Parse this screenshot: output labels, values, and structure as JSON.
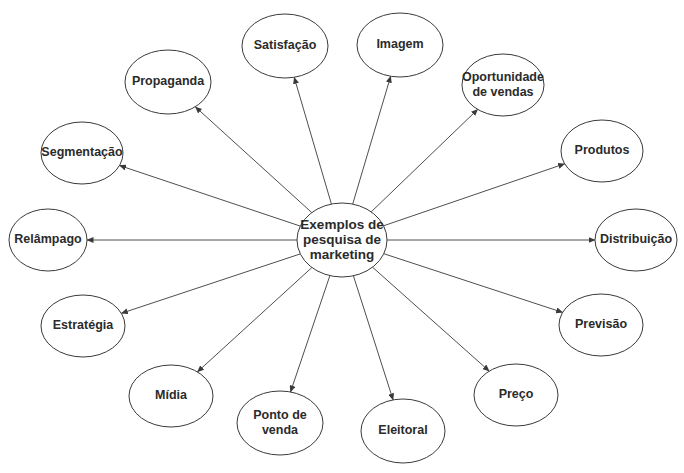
{
  "diagram": {
    "type": "radial-concept-map",
    "canvas": {
      "width": 684,
      "height": 473
    },
    "colors": {
      "stroke": "#3a3a3a",
      "fill": "#ffffff",
      "text": "#2b2b2b"
    },
    "center": {
      "id": "center",
      "lines": [
        "Exemplos de",
        "pesquisa de",
        "marketing"
      ],
      "cx": 342,
      "cy": 240,
      "rx": 45,
      "ry": 37
    },
    "nodes": [
      {
        "id": "satisfacao",
        "lines": [
          "Satisfação"
        ],
        "cx": 285,
        "cy": 46,
        "rx": 43,
        "ry": 32
      },
      {
        "id": "imagem",
        "lines": [
          "Imagem"
        ],
        "cx": 400,
        "cy": 45,
        "rx": 43,
        "ry": 32
      },
      {
        "id": "propaganda",
        "lines": [
          "Propaganda"
        ],
        "cx": 168,
        "cy": 82,
        "rx": 43,
        "ry": 32
      },
      {
        "id": "oportunidade-de-vendas",
        "lines": [
          "Oportunidade",
          "de vendas"
        ],
        "cx": 503,
        "cy": 85,
        "rx": 41,
        "ry": 31
      },
      {
        "id": "segmentacao",
        "lines": [
          "Segmentação"
        ],
        "cx": 82,
        "cy": 153,
        "rx": 41,
        "ry": 31
      },
      {
        "id": "produtos",
        "lines": [
          "Produtos"
        ],
        "cx": 602,
        "cy": 151,
        "rx": 41,
        "ry": 31
      },
      {
        "id": "relampago",
        "lines": [
          "Relâmpago"
        ],
        "cx": 48,
        "cy": 240,
        "rx": 39,
        "ry": 31
      },
      {
        "id": "distribuicao",
        "lines": [
          "Distribuição"
        ],
        "cx": 636,
        "cy": 240,
        "rx": 41,
        "ry": 31
      },
      {
        "id": "estrategia",
        "lines": [
          "Estratégia"
        ],
        "cx": 83,
        "cy": 326,
        "rx": 42,
        "ry": 31
      },
      {
        "id": "previsao",
        "lines": [
          "Previsão"
        ],
        "cx": 601,
        "cy": 325,
        "rx": 42,
        "ry": 31
      },
      {
        "id": "midia",
        "lines": [
          "Mídia"
        ],
        "cx": 171,
        "cy": 396,
        "rx": 42,
        "ry": 31
      },
      {
        "id": "preco",
        "lines": [
          "Preço"
        ],
        "cx": 516,
        "cy": 395,
        "rx": 42,
        "ry": 31
      },
      {
        "id": "ponto-de-venda",
        "lines": [
          "Ponto de",
          "venda"
        ],
        "cx": 280,
        "cy": 423,
        "rx": 43,
        "ry": 32
      },
      {
        "id": "eleitoral",
        "lines": [
          "Eleitoral"
        ],
        "cx": 403,
        "cy": 431,
        "rx": 42,
        "ry": 32
      }
    ],
    "edges": [
      {
        "from": "center",
        "to": "satisfacao",
        "arrow": "end"
      },
      {
        "from": "center",
        "to": "imagem",
        "arrow": "end"
      },
      {
        "from": "center",
        "to": "propaganda",
        "arrow": "end"
      },
      {
        "from": "center",
        "to": "oportunidade-de-vendas",
        "arrow": "end"
      },
      {
        "from": "center",
        "to": "segmentacao",
        "arrow": "end"
      },
      {
        "from": "center",
        "to": "produtos",
        "arrow": "end"
      },
      {
        "from": "center",
        "to": "relampago",
        "arrow": "end"
      },
      {
        "from": "center",
        "to": "distribuicao",
        "arrow": "end"
      },
      {
        "from": "center",
        "to": "estrategia",
        "arrow": "end"
      },
      {
        "from": "center",
        "to": "previsao",
        "arrow": "end"
      },
      {
        "from": "center",
        "to": "midia",
        "arrow": "end"
      },
      {
        "from": "center",
        "to": "preco",
        "arrow": "end"
      },
      {
        "from": "center",
        "to": "ponto-de-venda",
        "arrow": "end"
      },
      {
        "from": "center",
        "to": "eleitoral",
        "arrow": "end"
      }
    ]
  }
}
